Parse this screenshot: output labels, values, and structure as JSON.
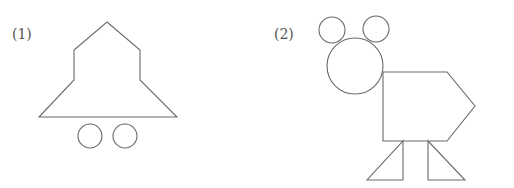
{
  "figures": [
    {
      "label": "(1)",
      "description": "bell shape built from a pentagon-like top over a trapezoid base with two circles beneath",
      "label_pos": [
        12,
        27
      ],
      "outline_points": "107,22 140,50 140,80 177,117 39,117 74,80 74,50",
      "circles": [
        {
          "cx": 90,
          "cy": 136,
          "r": 12
        },
        {
          "cx": 125,
          "cy": 136,
          "r": 12
        }
      ]
    },
    {
      "label": "(2)",
      "description": "animal figure built from circles (head, ears), a pentagon body and two triangle legs",
      "label_pos": [
        274,
        27
      ],
      "ears": [
        {
          "cx": 332,
          "cy": 30,
          "r": 13
        },
        {
          "cx": 376,
          "cy": 29,
          "r": 13
        }
      ],
      "head": {
        "cx": 355,
        "cy": 66,
        "r": 28
      },
      "body_points": "383,72 447,72 475,106 447,141 383,141",
      "legs": [
        "403,141 403,180 367,180",
        "428,141 428,180 465,180"
      ]
    }
  ],
  "colors": {
    "stroke": "#6a6a6a",
    "label": "#555555",
    "background": "#ffffff"
  }
}
